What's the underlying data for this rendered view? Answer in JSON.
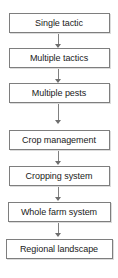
{
  "diagram": {
    "type": "vertical-flowchart",
    "title": "",
    "background_color": "#ffffff",
    "box_border_color": "#7e7e7e",
    "box_fill_color": "#ffffff",
    "text_color": "#1a1a1a",
    "arrow_color": "#808080",
    "nodes": [
      {
        "label": "Single tactic"
      },
      {
        "label": "Multiple tactics"
      },
      {
        "label": "Multiple pests"
      },
      {
        "label": "Crop management"
      },
      {
        "label": "Cropping system"
      },
      {
        "label": "Whole farm system"
      },
      {
        "label": "Regional landscape"
      }
    ],
    "connectors": [
      {
        "from": "Single tactic",
        "to": "Multiple tactics",
        "direction": "down"
      },
      {
        "from": "Multiple tactics",
        "to": "Multiple pests",
        "direction": "down"
      },
      {
        "from": "Multiple pests",
        "to": "Crop management",
        "direction": "down"
      },
      {
        "from": "Crop management",
        "to": "Cropping system",
        "direction": "down"
      },
      {
        "from": "Cropping system",
        "to": "Whole farm system",
        "direction": "down"
      },
      {
        "from": "Whole farm system",
        "to": "Regional landscape",
        "direction": "down"
      }
    ]
  }
}
